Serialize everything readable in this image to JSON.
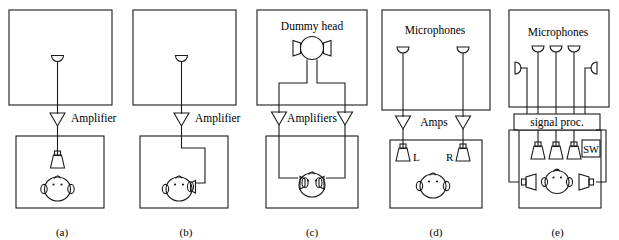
{
  "figure": {
    "line_color": "#1a1a1a",
    "background": "#ffffff",
    "panel_count": 5
  },
  "panels": [
    {
      "id": "a",
      "caption": "(a)",
      "description": "Monophonic recording and loudspeaker reproduction",
      "labels": {
        "amplifier": "Amplifier"
      },
      "components": {
        "source_room_mic": "microphone",
        "amplifier": "amplifier-triangle",
        "listening_room_speaker": "loudspeaker",
        "listener": "listener-head"
      }
    },
    {
      "id": "b",
      "caption": "(b)",
      "description": "Monophonic recording and headphone reproduction",
      "labels": {
        "amplifier": "Amplifier"
      },
      "components": {
        "source_room_mic": "microphone",
        "amplifier": "amplifier-triangle",
        "listening_room_transducer": "headphone",
        "listener": "listener-head-headphone"
      }
    },
    {
      "id": "c",
      "caption": "(c)",
      "description": "Binaural dummy head recording with headphone reproduction",
      "labels": {
        "dummy_head": "Dummy head",
        "amplifiers": "Amplifiers"
      },
      "components": {
        "source_room_pickup": "dummy-head",
        "amplifier_left": "amplifier-triangle",
        "amplifier_right": "amplifier-triangle",
        "listener": "listener-head-headphones"
      }
    },
    {
      "id": "d",
      "caption": "(d)",
      "description": "Two-channel stereophonic recording and reproduction",
      "labels": {
        "microphones": "Microphones",
        "amps": "Amps",
        "left": "L",
        "right": "R"
      },
      "components": {
        "microphone_left": "microphone",
        "microphone_right": "microphone",
        "amplifier_left": "amplifier-triangle",
        "amplifier_right": "amplifier-triangle",
        "speaker_left": "loudspeaker",
        "speaker_right": "loudspeaker",
        "listener": "listener-head"
      }
    },
    {
      "id": "e",
      "caption": "(e)",
      "description": "Multichannel recording with signal processing and surround reproduction",
      "labels": {
        "microphones": "Microphones",
        "signal_processor": "signal proc.",
        "sw": "SW"
      },
      "components": {
        "microphone_count": 5,
        "front_microphones": 3,
        "side_microphones": 2,
        "signal_processor": "signal-processor-box",
        "subwoofer": "sw-box",
        "front_speakers": 3,
        "surround_speakers": 2,
        "listener": "listener-head"
      }
    }
  ]
}
